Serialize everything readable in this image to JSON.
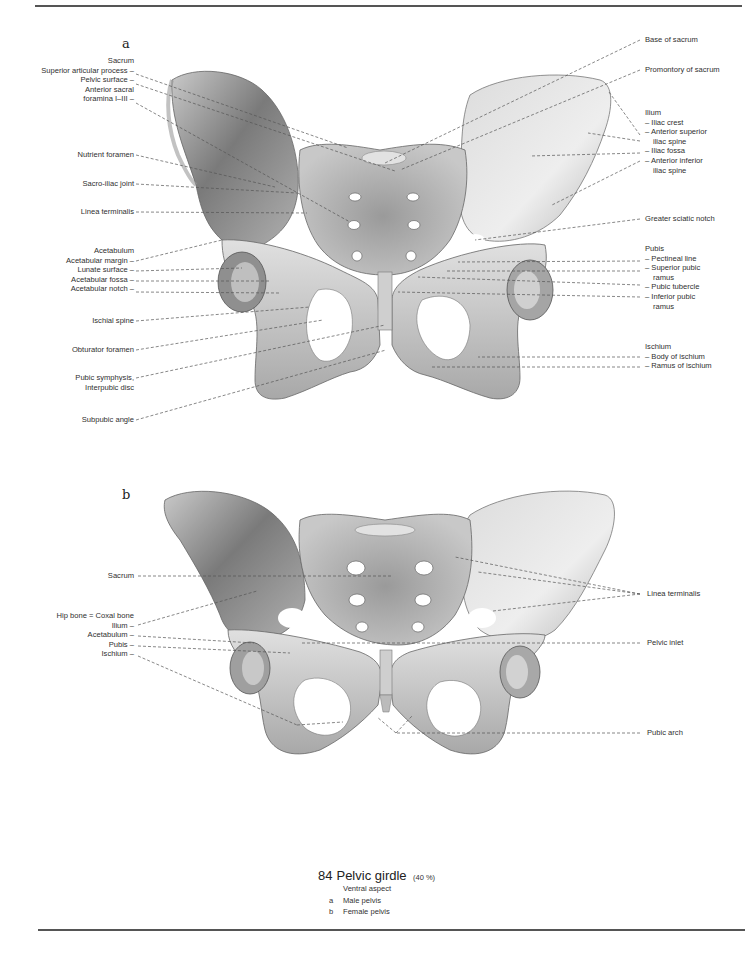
{
  "figure": {
    "number": "84",
    "title": "Pelvic girdle",
    "scale": "(40 %)",
    "aspect": "Ventral aspect",
    "legend": [
      {
        "key": "a",
        "text": "Male pelvis"
      },
      {
        "key": "b",
        "text": "Female pelvis"
      }
    ]
  },
  "panel_a": {
    "letter": "a",
    "left_labels": {
      "sacrum_group": [
        "Sacrum",
        "Superior articular process –",
        "Pelvic surface –",
        "Anterior sacral",
        "foramina I–III –"
      ],
      "nutrient_foramen": "Nutrient foramen",
      "sacro_iliac_joint": "Sacro-iliac joint",
      "linea_terminalis": "Linea terminalis",
      "acetabulum_group": [
        "Acetabulum",
        "Acetabular margin –",
        "Lunate surface –",
        "Acetabular fossa –",
        "Acetabular notch –"
      ],
      "ischial_spine": "Ischial spine",
      "obturator_foramen": "Obturator foramen",
      "pubic_symphysis": [
        "Pubic symphysis,",
        "Interpubic disc"
      ],
      "subpubic_angle": "Subpubic angle"
    },
    "right_labels": {
      "base_of_sacrum": "Base of sacrum",
      "promontory": "Promontory of sacrum",
      "ilium_group": [
        "Ilium",
        "– Iliac crest",
        "– Anterior superior",
        "iliac spine",
        "– Iliac fossa",
        "– Anterior inferior",
        "iliac spine"
      ],
      "greater_sciatic_notch": "Greater sciatic notch",
      "pubis_group": [
        "Pubis",
        "– Pectineal line",
        "– Superior pubic",
        "ramus",
        "– Pubic tubercle",
        "– Inferior pubic",
        "ramus"
      ],
      "ischium_group": [
        "Ischium",
        "– Body of ischium",
        "– Ramus of ischium"
      ]
    }
  },
  "panel_b": {
    "letter": "b",
    "left_labels": {
      "sacrum": "Sacrum",
      "hip_bone_group": [
        "Hip bone = Coxal bone",
        "Ilium –",
        "Acetabulum –",
        "Pubis –",
        "Ischium –"
      ]
    },
    "right_labels": {
      "linea_terminalis": "Linea terminalis",
      "pelvic_inlet": "Pelvic inlet",
      "pubic_arch": "Pubic arch"
    }
  },
  "colors": {
    "bone_light": "#e6e6e6",
    "bone_mid": "#bdbdbd",
    "bone_dark": "#6f6f6f",
    "leader": "#555555",
    "text": "#2f2f2f"
  }
}
